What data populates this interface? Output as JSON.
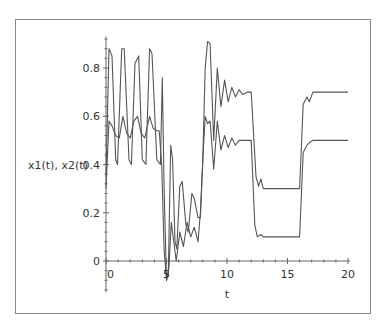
{
  "chart_data": {
    "type": "line",
    "title": "",
    "xlabel": "t",
    "ylabel": "x1(t), x2(t)",
    "xlim": [
      0,
      20
    ],
    "ylim": [
      -0.13,
      0.93
    ],
    "xticks": [
      "0",
      "5",
      "10",
      "15",
      "20"
    ],
    "yticks": [
      "0",
      "0.2",
      "0.4",
      "0.6",
      "0.8"
    ],
    "grid": false,
    "legend": null,
    "line_color": "#555555",
    "series": [
      {
        "name": "x1(t)",
        "points": [
          [
            0,
            0.35
          ],
          [
            0.25,
            0.88
          ],
          [
            0.5,
            0.85
          ],
          [
            0.8,
            0.42
          ],
          [
            0.95,
            0.4
          ],
          [
            1.3,
            0.88
          ],
          [
            1.5,
            0.88
          ],
          [
            1.9,
            0.42
          ],
          [
            2.1,
            0.4
          ],
          [
            2.4,
            0.82
          ],
          [
            2.7,
            0.85
          ],
          [
            3.0,
            0.42
          ],
          [
            3.3,
            0.4
          ],
          [
            3.6,
            0.88
          ],
          [
            3.8,
            0.86
          ],
          [
            4.2,
            0.42
          ],
          [
            4.5,
            0.4
          ],
          [
            4.65,
            0.76
          ],
          [
            4.8,
            0.3
          ],
          [
            5.0,
            -0.08
          ],
          [
            5.15,
            -0.05
          ],
          [
            5.35,
            0.48
          ],
          [
            5.5,
            0.42
          ],
          [
            5.7,
            0.08
          ],
          [
            5.85,
            0.05
          ],
          [
            6.1,
            0.31
          ],
          [
            6.3,
            0.33
          ],
          [
            6.6,
            0.15
          ],
          [
            6.8,
            0.12
          ],
          [
            7.1,
            0.28
          ],
          [
            7.3,
            0.26
          ],
          [
            7.6,
            0.18
          ],
          [
            7.8,
            0.18
          ],
          [
            8.0,
            0.42
          ],
          [
            8.2,
            0.8
          ],
          [
            8.4,
            0.91
          ],
          [
            8.6,
            0.9
          ],
          [
            8.9,
            0.5
          ],
          [
            9.2,
            0.8
          ],
          [
            9.5,
            0.64
          ],
          [
            9.8,
            0.75
          ],
          [
            10.1,
            0.66
          ],
          [
            10.4,
            0.72
          ],
          [
            10.7,
            0.68
          ],
          [
            11.0,
            0.71
          ],
          [
            11.3,
            0.69
          ],
          [
            11.7,
            0.7
          ],
          [
            12.0,
            0.7
          ],
          [
            12.4,
            0.35
          ],
          [
            12.6,
            0.31
          ],
          [
            12.8,
            0.34
          ],
          [
            13.0,
            0.3
          ],
          [
            13.5,
            0.3
          ],
          [
            16.0,
            0.3
          ],
          [
            16.3,
            0.65
          ],
          [
            16.6,
            0.68
          ],
          [
            16.8,
            0.66
          ],
          [
            17.1,
            0.7
          ],
          [
            20.0,
            0.7
          ]
        ]
      },
      {
        "name": "x2(t)",
        "points": [
          [
            0,
            0.3
          ],
          [
            0.25,
            0.58
          ],
          [
            0.5,
            0.56
          ],
          [
            0.8,
            0.52
          ],
          [
            1.1,
            0.51
          ],
          [
            1.4,
            0.6
          ],
          [
            1.7,
            0.53
          ],
          [
            2.0,
            0.51
          ],
          [
            2.3,
            0.58
          ],
          [
            2.6,
            0.6
          ],
          [
            2.9,
            0.53
          ],
          [
            3.2,
            0.51
          ],
          [
            3.6,
            0.6
          ],
          [
            3.9,
            0.55
          ],
          [
            4.2,
            0.54
          ],
          [
            4.4,
            0.54
          ],
          [
            4.6,
            0.4
          ],
          [
            4.8,
            0.05
          ],
          [
            5.0,
            -0.08
          ],
          [
            5.2,
            -0.03
          ],
          [
            5.4,
            0.16
          ],
          [
            5.6,
            0.08
          ],
          [
            5.8,
            0.0
          ],
          [
            6.1,
            0.12
          ],
          [
            6.4,
            0.06
          ],
          [
            6.7,
            0.16
          ],
          [
            7.0,
            0.1
          ],
          [
            7.3,
            0.14
          ],
          [
            7.6,
            0.08
          ],
          [
            7.8,
            0.2
          ],
          [
            8.0,
            0.42
          ],
          [
            8.2,
            0.6
          ],
          [
            8.4,
            0.57
          ],
          [
            8.6,
            0.58
          ],
          [
            8.9,
            0.38
          ],
          [
            9.2,
            0.58
          ],
          [
            9.5,
            0.46
          ],
          [
            9.8,
            0.52
          ],
          [
            10.1,
            0.47
          ],
          [
            10.4,
            0.51
          ],
          [
            10.7,
            0.48
          ],
          [
            11.0,
            0.5
          ],
          [
            11.7,
            0.5
          ],
          [
            12.0,
            0.5
          ],
          [
            12.3,
            0.15
          ],
          [
            12.5,
            0.1
          ],
          [
            12.8,
            0.11
          ],
          [
            13.0,
            0.1
          ],
          [
            16.0,
            0.1
          ],
          [
            16.3,
            0.45
          ],
          [
            16.6,
            0.48
          ],
          [
            16.8,
            0.49
          ],
          [
            17.1,
            0.5
          ],
          [
            20.0,
            0.5
          ]
        ]
      }
    ]
  }
}
